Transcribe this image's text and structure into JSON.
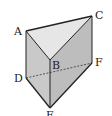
{
  "diagram": {
    "type": "triangular-prism",
    "vertices": {
      "A": {
        "label": "A",
        "x": 26,
        "y": 31,
        "lx": 14,
        "ly": 35
      },
      "B": {
        "label": "B",
        "x": 50,
        "y": 60,
        "lx": 52,
        "ly": 69
      },
      "C": {
        "label": "C",
        "x": 92,
        "y": 16,
        "lx": 95,
        "ly": 19
      },
      "D": {
        "label": "D",
        "x": 26,
        "y": 78,
        "lx": 14,
        "ly": 82
      },
      "E": {
        "label": "E",
        "x": 50,
        "y": 108,
        "lx": 46,
        "ly": 119
      },
      "F": {
        "label": "F",
        "x": 92,
        "y": 63,
        "lx": 95,
        "ly": 66
      }
    },
    "faces": {
      "top": {
        "name": "ABC",
        "color": "#e6e6e6"
      },
      "front": {
        "name": "ABED",
        "color": "#c9c9c9"
      },
      "right": {
        "name": "BCFE",
        "color": "#bdbdbd"
      }
    },
    "hidden_edges": [
      "DF"
    ],
    "edge_color": "#222222"
  }
}
